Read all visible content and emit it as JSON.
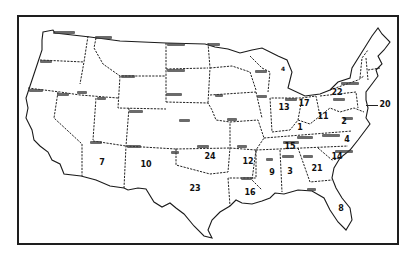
{
  "map": {
    "type": "outline map",
    "subject": "United States (contiguous states) with numeric values per state",
    "colors": {
      "ink": "#1e1e1e",
      "background": "#ffffff"
    },
    "state_labels": [
      {
        "state": "Washington",
        "x": 53,
        "y": 32,
        "w": 22
      },
      {
        "state": "Montana",
        "x": 95,
        "y": 37,
        "w": 17
      },
      {
        "state": "North Dakota",
        "x": 167,
        "y": 43,
        "w": 18
      },
      {
        "state": "Minnesota",
        "x": 208,
        "y": 43,
        "w": 12
      },
      {
        "state": "Oregon",
        "x": 40,
        "y": 60,
        "w": 12
      },
      {
        "state": "South Dakota",
        "x": 167,
        "y": 69,
        "w": 18
      },
      {
        "state": "Wyoming",
        "x": 121,
        "y": 75,
        "w": 14
      },
      {
        "state": "Nebraska",
        "x": 166,
        "y": 93,
        "w": 16
      },
      {
        "state": "California",
        "x": 29,
        "y": 89,
        "w": 14
      },
      {
        "state": "Nevada",
        "x": 57,
        "y": 93,
        "w": 12
      },
      {
        "state": "Idaho",
        "x": 77,
        "y": 91,
        "w": 10
      },
      {
        "state": "Utah",
        "x": 97,
        "y": 97,
        "w": 9
      },
      {
        "state": "Colorado",
        "x": 129,
        "y": 110,
        "w": 14
      },
      {
        "state": "Kansas",
        "x": 179,
        "y": 119,
        "w": 11
      },
      {
        "state": "Arizona",
        "x": 90,
        "y": 141,
        "w": 12
      },
      {
        "state": "New Mexico",
        "x": 127,
        "y": 145,
        "w": 14
      },
      {
        "state": "Texas",
        "x": 171,
        "y": 151,
        "w": 8
      },
      {
        "state": "Oklahoma",
        "x": 197,
        "y": 145,
        "w": 12
      },
      {
        "state": "Arkansas",
        "x": 237,
        "y": 145,
        "w": 10
      },
      {
        "state": "Missouri",
        "x": 227,
        "y": 118,
        "w": 10
      },
      {
        "state": "Iowa",
        "x": 215,
        "y": 94,
        "w": 8
      },
      {
        "state": "Wisconsin",
        "x": 255,
        "y": 70,
        "w": 12
      },
      {
        "state": "Illinois",
        "x": 257,
        "y": 95,
        "w": 10
      },
      {
        "state": "Kentucky",
        "x": 297,
        "y": 136,
        "w": 16
      },
      {
        "state": "Virginia",
        "x": 322,
        "y": 134,
        "w": 18
      },
      {
        "state": "Tennessee",
        "x": 283,
        "y": 141,
        "w": 16
      },
      {
        "state": "North Carolina",
        "x": 335,
        "y": 150,
        "w": 18
      },
      {
        "state": "Mississippi",
        "x": 266,
        "y": 158,
        "w": 7
      },
      {
        "state": "Alabama",
        "x": 282,
        "y": 155,
        "w": 12
      },
      {
        "state": "Georgia",
        "x": 303,
        "y": 155,
        "w": 10
      },
      {
        "state": "Louisiana",
        "x": 241,
        "y": 177,
        "w": 11
      },
      {
        "state": "Florida",
        "x": 307,
        "y": 188,
        "w": 9
      },
      {
        "state": "New York",
        "x": 341,
        "y": 82,
        "w": 18
      },
      {
        "state": "Michigan",
        "x": 285,
        "y": 98,
        "w": 12
      },
      {
        "state": "Pennsylvania",
        "x": 333,
        "y": 98,
        "w": 12
      },
      {
        "state": "Maryland",
        "x": 343,
        "y": 117,
        "w": 10
      }
    ],
    "values": [
      {
        "state": "Arizona",
        "value": "7",
        "x": 102,
        "y": 163
      },
      {
        "state": "New Mexico",
        "value": "10",
        "x": 146,
        "y": 165
      },
      {
        "state": "Texas",
        "value": "23",
        "x": 195,
        "y": 189
      },
      {
        "state": "Oklahoma",
        "value": "24",
        "x": 210,
        "y": 157
      },
      {
        "state": "Arkansas",
        "value": "12",
        "x": 248,
        "y": 162
      },
      {
        "state": "Louisiana",
        "value": "16",
        "x": 250,
        "y": 193
      },
      {
        "state": "Mississippi",
        "value": "9",
        "x": 272,
        "y": 173
      },
      {
        "state": "Alabama",
        "value": "3",
        "x": 290,
        "y": 172
      },
      {
        "state": "Georgia",
        "value": "21",
        "x": 317,
        "y": 169
      },
      {
        "state": "South Carolina",
        "value": "14",
        "x": 337,
        "y": 157
      },
      {
        "state": "Florida",
        "value": "8",
        "x": 341,
        "y": 209
      },
      {
        "state": "North Carolina",
        "value": "4",
        "x": 347,
        "y": 140
      },
      {
        "state": "Tennessee",
        "value": "15",
        "x": 290,
        "y": 147
      },
      {
        "state": "Kentucky",
        "value": "1",
        "x": 300,
        "y": 128
      },
      {
        "state": "Indiana",
        "value": "13",
        "x": 284,
        "y": 108
      },
      {
        "state": "Ohio",
        "value": "17",
        "x": 304,
        "y": 104
      },
      {
        "state": "West Virginia",
        "value": "11",
        "x": 323,
        "y": 117
      },
      {
        "state": "Virginia",
        "value": "2",
        "x": 344,
        "y": 122
      },
      {
        "state": "Pennsylvania",
        "value": "22",
        "x": 337,
        "y": 93
      },
      {
        "state": "Delaware/Maryland area",
        "value": "20",
        "x": 383,
        "y": 105
      },
      {
        "state": "Michigan",
        "value": "4",
        "x": 283,
        "y": 69
      }
    ]
  }
}
